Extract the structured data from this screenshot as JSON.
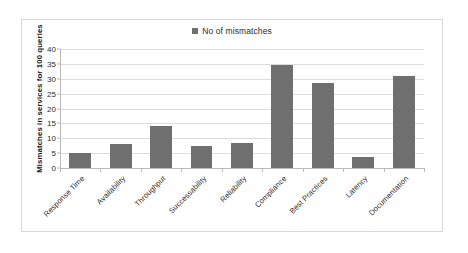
{
  "chart_data": {
    "type": "bar",
    "title": "",
    "xlabel": "",
    "ylabel": "Mismatches in services for 100 queries",
    "ylim": [
      0,
      40
    ],
    "ytick_step": 5,
    "yticks": [
      40,
      35,
      30,
      25,
      20,
      15,
      10,
      5,
      0
    ],
    "grid": true,
    "legend_position": "top-center",
    "categories": [
      "Response Time",
      "Availability",
      "Throughput",
      "Successability",
      "Reliability",
      "Compliance",
      "Best Practices",
      "Latency",
      "Documentation"
    ],
    "series": [
      {
        "name": "No of mismatches",
        "color": "#6f6f6f",
        "values": [
          5,
          8,
          14,
          7.3,
          8.5,
          34.5,
          28.5,
          3.8,
          31
        ]
      }
    ]
  },
  "legend": {
    "marker_icon": "square-marker-icon",
    "label": "No of mismatches"
  },
  "colors": {
    "bar": "#6f6f6f",
    "gridline": "#dcdcdc",
    "axis": "#b9b9b9",
    "border": "#d8d8d8",
    "text": "#2b2b2b",
    "background": "#ffffff"
  }
}
